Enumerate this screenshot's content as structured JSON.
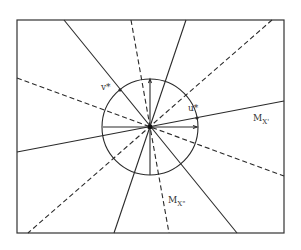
{
  "diagram": {
    "type": "geometric construction: circle with radial lines",
    "labels": {
      "v_star": "v*",
      "u_star": "u*",
      "mx1_main": "M",
      "mx1_sub": "X'",
      "mx2_main": "M",
      "mx2_sub": "X\""
    },
    "frame": {
      "x1": 17,
      "y1": 20,
      "x2": 284,
      "y2": 233
    },
    "center": {
      "x": 150,
      "y": 127
    },
    "circle_radius": 48,
    "solid_lines": [
      {
        "from": [
          64,
          20
        ],
        "to": [
          237,
          233
        ],
        "name": "solid-line-v-star"
      },
      {
        "from": [
          186,
          20
        ],
        "to": [
          114,
          233
        ],
        "name": "solid-line-steep"
      },
      {
        "from": [
          17,
          152
        ],
        "to": [
          284,
          101
        ],
        "name": "solid-line-mx-prime"
      }
    ],
    "dashed_lines": [
      {
        "from": [
          131,
          20
        ],
        "to": [
          169,
          233
        ],
        "name": "dashed-line-mx-double-prime"
      },
      {
        "from": [
          272,
          20
        ],
        "to": [
          28,
          233
        ],
        "name": "dashed-line-diagonal"
      },
      {
        "from": [
          17,
          78
        ],
        "to": [
          284,
          176
        ],
        "name": "dashed-line-shallow"
      }
    ],
    "axes": {
      "horizontal": {
        "from": [
          103,
          127
        ],
        "to": [
          197,
          127
        ]
      },
      "vertical": {
        "from": [
          150,
          79
        ],
        "to": [
          150,
          175
        ]
      }
    },
    "colors": {
      "stroke": "#2a2a2a",
      "background": "#ffffff"
    }
  }
}
